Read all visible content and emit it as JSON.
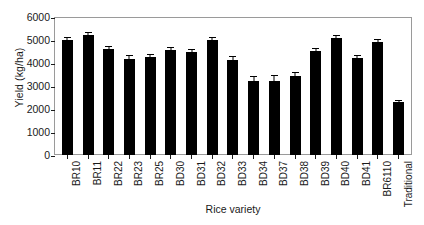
{
  "chart_data": {
    "type": "bar",
    "title": "",
    "xlabel": "Rice variety",
    "ylabel": "Yield (kg/ha)",
    "ylim": [
      0,
      6000
    ],
    "yticks": [
      0,
      1000,
      2000,
      3000,
      4000,
      5000,
      6000
    ],
    "ytick_labels": [
      "0",
      "1000",
      "2000",
      "3000",
      "4000",
      "5000",
      "6000"
    ],
    "grid": false,
    "legend": "none",
    "bar_color": "#000000",
    "error_bars": "standard error, capped",
    "categories": [
      "BR10",
      "BR11",
      "BR22",
      "BR23",
      "BR25",
      "BD30",
      "BD31",
      "BD32",
      "BD33",
      "BD34",
      "BD37",
      "BD38",
      "BD39",
      "BD40",
      "BD41",
      "BR6110",
      "Traditional"
    ],
    "values": [
      5020,
      5200,
      4620,
      4180,
      4270,
      4560,
      4480,
      4980,
      4150,
      3230,
      3230,
      3450,
      4530,
      5100,
      4200,
      4900,
      2300
    ],
    "errors": [
      110,
      130,
      140,
      160,
      110,
      130,
      110,
      130,
      160,
      200,
      230,
      180,
      140,
      130,
      150,
      150,
      110
    ]
  }
}
